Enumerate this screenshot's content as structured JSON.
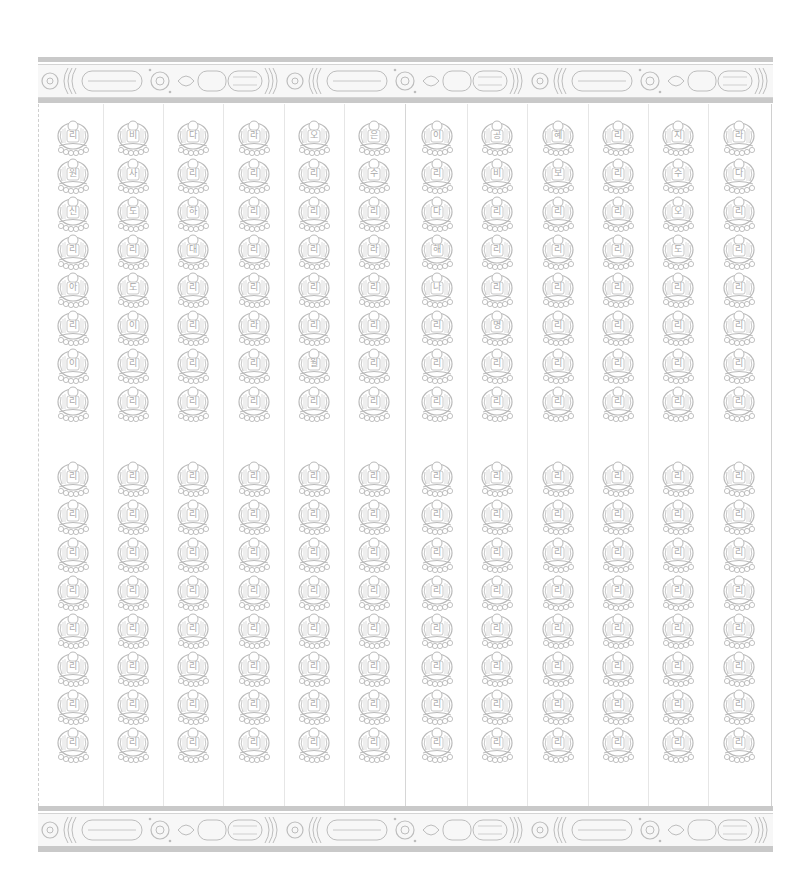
{
  "document": {
    "type": "woodblock print",
    "subject": "Thousand Buddhas grid",
    "ink_color": "#b8b8b8",
    "band_color": "#c9c9c9",
    "columns": 12,
    "rows_upper": 8,
    "rows_lower": 8
  },
  "borders": {
    "top": {
      "band1_y": 57,
      "ornament_y": 64,
      "band2_y": 98
    },
    "bottom": {
      "band1_y": 806,
      "ornament_y": 813,
      "band2_y": 846
    }
  },
  "labels": {
    "upper": [
      [
        "리",
        "비",
        "다",
        "라",
        "오",
        "은",
        "이",
        "공",
        "혜",
        "리",
        "지",
        "라"
      ],
      [
        "원",
        "사",
        "리",
        "리",
        "리",
        "수",
        "리",
        "비",
        "보",
        "리",
        "수",
        "다"
      ],
      [
        "신",
        "도",
        "하",
        "리",
        "리",
        "리",
        "다",
        "리",
        "리",
        "리",
        "오",
        "리"
      ],
      [
        "리",
        "리",
        "대",
        "리",
        "리",
        "라",
        "해",
        "리",
        "리",
        "리",
        "도",
        "리"
      ],
      [
        "아",
        "도",
        "리",
        "리",
        "리",
        "리",
        "나",
        "리",
        "리",
        "리",
        "리",
        "리"
      ],
      [
        "리",
        "이",
        "리",
        "라",
        "리",
        "리",
        "리",
        "명",
        "리",
        "리",
        "리",
        "리"
      ],
      [
        "이",
        "리",
        "리",
        "리",
        "월",
        "리",
        "리",
        "리",
        "리",
        "리",
        "리",
        "리"
      ],
      [
        "리",
        "리",
        "리",
        "리",
        "리",
        "리",
        "리",
        "리",
        "리",
        "리",
        "리",
        "리"
      ]
    ],
    "lower": [
      [
        "리",
        "리",
        "리",
        "리",
        "리",
        "리",
        "리",
        "리",
        "리",
        "리",
        "리",
        "리"
      ],
      [
        "리",
        "리",
        "리",
        "리",
        "리",
        "리",
        "리",
        "리",
        "리",
        "리",
        "리",
        "리"
      ],
      [
        "리",
        "리",
        "리",
        "리",
        "리",
        "리",
        "리",
        "리",
        "리",
        "리",
        "리",
        "리"
      ],
      [
        "리",
        "리",
        "리",
        "리",
        "리",
        "리",
        "리",
        "리",
        "리",
        "리",
        "리",
        "리"
      ],
      [
        "리",
        "리",
        "리",
        "리",
        "리",
        "리",
        "리",
        "리",
        "리",
        "리",
        "리",
        "리"
      ],
      [
        "리",
        "리",
        "리",
        "리",
        "리",
        "리",
        "리",
        "리",
        "리",
        "리",
        "리",
        "리"
      ],
      [
        "리",
        "리",
        "리",
        "리",
        "리",
        "리",
        "리",
        "리",
        "리",
        "리",
        "리",
        "리"
      ],
      [
        "리",
        "리",
        "리",
        "리",
        "리",
        "리",
        "리",
        "리",
        "리",
        "리",
        "리",
        "리"
      ]
    ]
  }
}
